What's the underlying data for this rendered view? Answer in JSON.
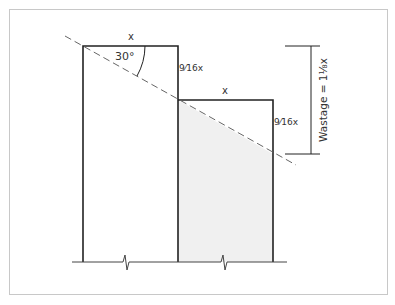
{
  "diagram": {
    "labels": {
      "top_width": "x",
      "lower_width": "x",
      "angle": "30°",
      "step_height_1": "9⁄16x",
      "step_height_2": "9⁄16x",
      "wastage": "Wastage = 1⅛x"
    },
    "colors": {
      "line": "#222222",
      "dash": "#666666",
      "shade": "#f0f0f0",
      "frame": "#c8c8c8"
    }
  }
}
